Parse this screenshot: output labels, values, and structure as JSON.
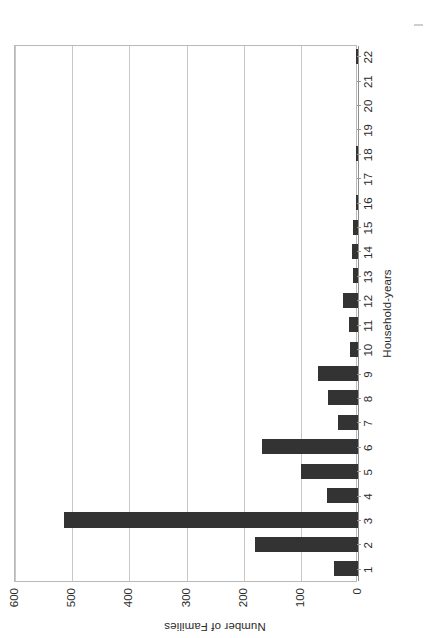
{
  "document": {
    "orientation": "rotated-90-ccw",
    "page_background": "#ffffff"
  },
  "chart_data": {
    "type": "bar",
    "orientation": "vertical",
    "title": "",
    "xlabel": "Household-years",
    "ylabel": "Number of Families",
    "categories": [
      "1",
      "2",
      "3",
      "4",
      "5",
      "6",
      "7",
      "8",
      "9",
      "10",
      "11",
      "12",
      "13",
      "14",
      "15",
      "16",
      "17",
      "18",
      "19",
      "20",
      "21",
      "22"
    ],
    "values": [
      42,
      180,
      515,
      55,
      100,
      168,
      35,
      52,
      70,
      14,
      16,
      26,
      8,
      10,
      9,
      3,
      0,
      4,
      0,
      0,
      0,
      3
    ],
    "ylim": [
      0,
      600
    ],
    "ytick_labels": [
      "0",
      "100",
      "200",
      "300",
      "400",
      "500",
      "600"
    ],
    "ytick_values": [
      0,
      100,
      200,
      300,
      400,
      500,
      600
    ],
    "grid": true,
    "legend": false,
    "bar_color": "#333333",
    "gridline_color": "#c8c8c8",
    "axis_color": "#8d8d8d"
  },
  "axes": {
    "value_axis_title": "Number of Families",
    "category_axis_title": "Household-years"
  }
}
